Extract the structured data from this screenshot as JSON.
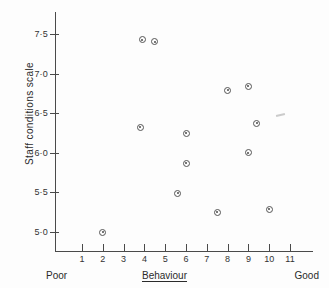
{
  "figure": {
    "background": "#fdfdfd",
    "ink_color": "#4a4a4a"
  },
  "axes": {
    "y_title": "Staff conditions scale",
    "y_ticks": [
      "7·5",
      "7·0",
      "6·5",
      "6·0",
      "5·5",
      "5·0"
    ],
    "y_tick_values": [
      7.5,
      7.0,
      6.5,
      6.0,
      5.5,
      5.0
    ],
    "x_ticks": [
      "1",
      "2",
      "3",
      "4",
      "5",
      "6",
      "7",
      "8",
      "9",
      "10",
      "11"
    ],
    "x_tick_values": [
      1,
      2,
      3,
      4,
      5,
      6,
      7,
      8,
      9,
      10,
      11
    ]
  },
  "captions": {
    "left": "Poor",
    "center": "Behaviour",
    "right": "Good"
  },
  "chart_data": {
    "type": "scatter",
    "title": "",
    "xlabel": "Behaviour",
    "ylabel": "Staff conditions scale",
    "xlim": [
      0.4,
      12.4
    ],
    "ylim": [
      4.72,
      7.72
    ],
    "grid": false,
    "legend": null,
    "marker": "circle-with-centre-dot",
    "x": [
      2.0,
      3.8,
      3.9,
      4.5,
      5.6,
      6.0,
      6.0,
      7.5,
      8.0,
      9.0,
      9.0,
      9.4,
      10.0
    ],
    "y": [
      5.0,
      6.32,
      7.43,
      7.4,
      5.49,
      6.25,
      5.87,
      5.25,
      6.79,
      6.84,
      6.0,
      6.37,
      5.29
    ],
    "points": [
      {
        "x": 2.0,
        "y": 5.0
      },
      {
        "x": 3.8,
        "y": 6.32
      },
      {
        "x": 3.9,
        "y": 7.43
      },
      {
        "x": 4.5,
        "y": 7.4
      },
      {
        "x": 5.6,
        "y": 5.49
      },
      {
        "x": 6.0,
        "y": 6.25
      },
      {
        "x": 6.0,
        "y": 5.87
      },
      {
        "x": 7.5,
        "y": 5.25
      },
      {
        "x": 8.0,
        "y": 6.79
      },
      {
        "x": 9.0,
        "y": 6.84
      },
      {
        "x": 9.0,
        "y": 6.0
      },
      {
        "x": 9.4,
        "y": 6.37
      },
      {
        "x": 10.0,
        "y": 5.29
      }
    ],
    "axis_annotations": {
      "x_low_end": "Poor",
      "x_high_end": "Good"
    }
  }
}
